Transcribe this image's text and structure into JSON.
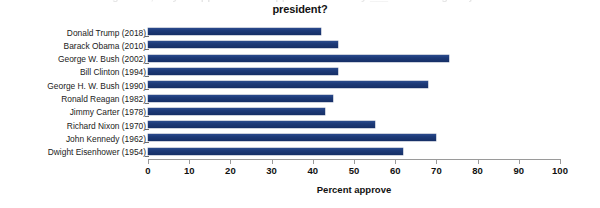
{
  "title": {
    "line1": "In general, do you approve or disapprove of the way ___ is handling his job as",
    "line2": "president?"
  },
  "x_axis_title": "Percent approve",
  "colors": {
    "bar": "#1e3a77",
    "axis": "#9a9a9a",
    "text": "#141414"
  },
  "chart_data": {
    "type": "bar",
    "orientation": "horizontal",
    "title": "In general, do you approve or disapprove of the way ___ is handling his job as president?",
    "xlabel": "Percent approve",
    "ylabel": "",
    "xlim": [
      0,
      100
    ],
    "grid": false,
    "legend": null,
    "categories": [
      "Donald Trump (2018)",
      "Barack Obama (2010)",
      "George W. Bush (2002)",
      "Bill Clinton (1994)",
      "George H. W. Bush (1990)",
      "Ronald Reagan (1982)",
      "Jimmy Carter (1978)",
      "Richard Nixon (1970)",
      "John Kennedy (1962)",
      "Dwight Eisenhower (1954)"
    ],
    "values": [
      42,
      46,
      73,
      46,
      68,
      45,
      43,
      55,
      70,
      62
    ],
    "tick_labels": [
      "0",
      "10",
      "20",
      "30",
      "40",
      "50",
      "60",
      "70",
      "80",
      "90",
      "100"
    ],
    "ticks": [
      0,
      10,
      20,
      30,
      40,
      50,
      60,
      70,
      80,
      90,
      100
    ]
  }
}
